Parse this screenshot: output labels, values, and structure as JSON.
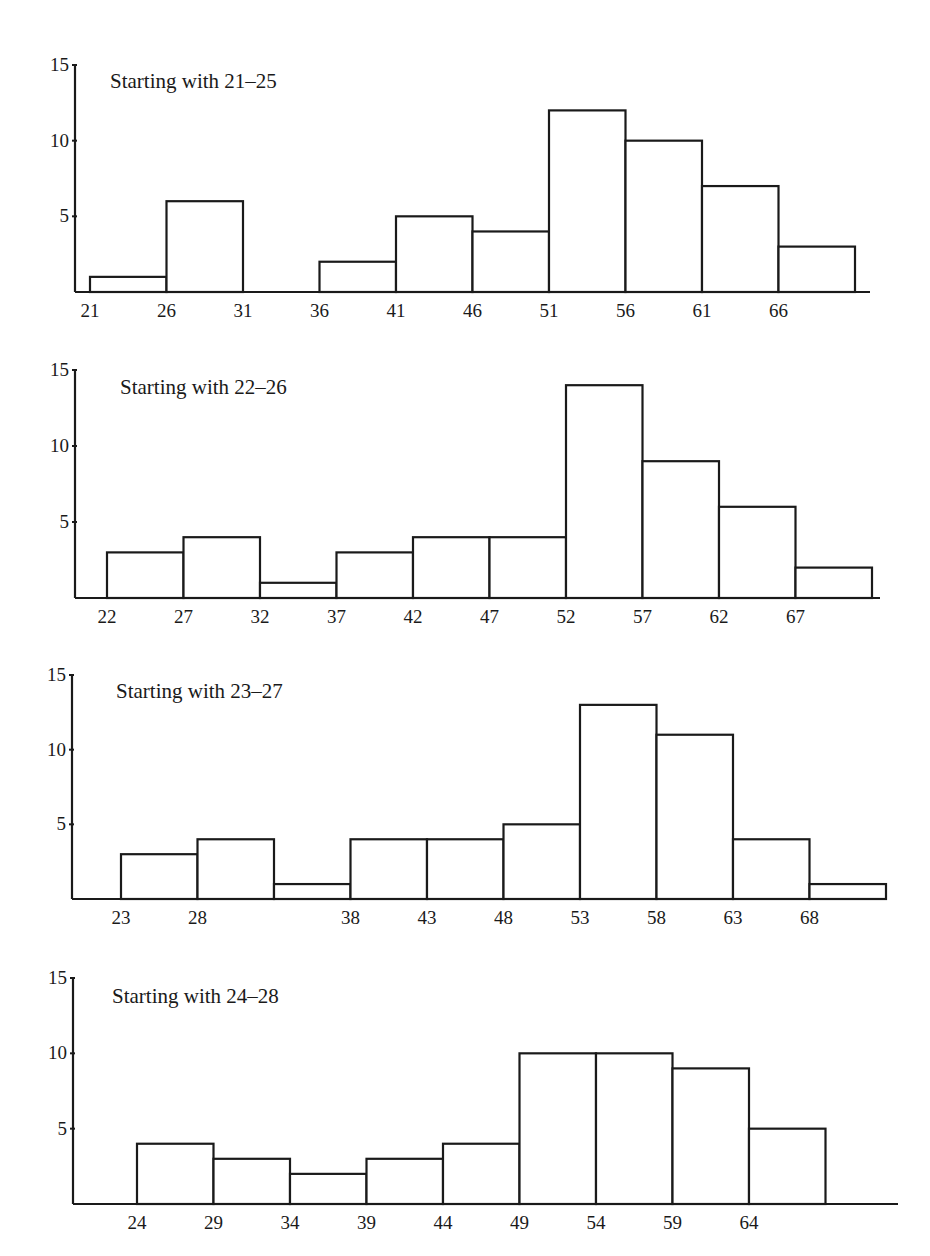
{
  "chart_data": [
    {
      "type": "bar",
      "title": "Starting with 21–25",
      "xlabel": "",
      "ylabel": "",
      "ylim": [
        0,
        15
      ],
      "yticks": [
        5,
        10,
        15
      ],
      "bin_width": 5,
      "x_tick_labels": [
        "21",
        "26",
        "31",
        "36",
        "41",
        "46",
        "51",
        "56",
        "61",
        "66"
      ],
      "bin_starts": [
        21,
        26,
        31,
        36,
        41,
        46,
        51,
        56,
        61,
        66
      ],
      "values": [
        1,
        6,
        0,
        2,
        5,
        4,
        12,
        10,
        7,
        3
      ],
      "grid": false
    },
    {
      "type": "bar",
      "title": "Starting with 22–26",
      "xlabel": "",
      "ylabel": "",
      "ylim": [
        0,
        15
      ],
      "yticks": [
        5,
        10,
        15
      ],
      "bin_width": 5,
      "x_tick_labels": [
        "22",
        "27",
        "32",
        "37",
        "42",
        "47",
        "52",
        "57",
        "62",
        "67"
      ],
      "bin_starts": [
        22,
        27,
        32,
        37,
        42,
        47,
        52,
        57,
        62,
        67
      ],
      "values": [
        3,
        4,
        1,
        3,
        4,
        4,
        14,
        9,
        6,
        2
      ],
      "grid": false
    },
    {
      "type": "bar",
      "title": "Starting with 23–27",
      "xlabel": "",
      "ylabel": "",
      "ylim": [
        0,
        15
      ],
      "yticks": [
        5,
        10,
        15
      ],
      "bin_width": 5,
      "x_tick_labels": [
        "23",
        "28",
        "",
        "38",
        "43",
        "48",
        "53",
        "58",
        "63",
        "68"
      ],
      "bin_starts": [
        23,
        28,
        33,
        38,
        43,
        48,
        53,
        58,
        63,
        68
      ],
      "values": [
        3,
        4,
        1,
        4,
        4,
        5,
        13,
        11,
        4,
        1
      ],
      "grid": false
    },
    {
      "type": "bar",
      "title": "Starting with 24–28",
      "xlabel": "",
      "ylabel": "",
      "ylim": [
        0,
        15
      ],
      "yticks": [
        5,
        10,
        15
      ],
      "bin_width": 5,
      "x_tick_labels": [
        "24",
        "29",
        "34",
        "39",
        "44",
        "49",
        "54",
        "59",
        "64"
      ],
      "bin_starts": [
        24,
        29,
        34,
        39,
        44,
        49,
        54,
        59,
        64
      ],
      "values": [
        4,
        3,
        2,
        3,
        4,
        10,
        10,
        9,
        5
      ],
      "grid": false
    }
  ],
  "layout": [
    {
      "top": 50,
      "axis_x": 75,
      "y_top": 65,
      "baseline": 292,
      "x0": 90,
      "x_end": 870,
      "title_x": 110,
      "title_y": 88
    },
    {
      "top": 350,
      "axis_x": 75,
      "y_top": 370,
      "baseline": 598,
      "x0": 107,
      "x_end": 880,
      "title_x": 120,
      "title_y": 394
    },
    {
      "top": 660,
      "axis_x": 72,
      "y_top": 675,
      "baseline": 899,
      "x0": 121,
      "x_end": 882,
      "title_x": 116,
      "title_y": 698
    },
    {
      "top": 960,
      "axis_x": 73,
      "y_top": 978,
      "baseline": 1204,
      "x0": 137,
      "x_end": 898,
      "title_x": 112,
      "title_y": 1003
    }
  ]
}
